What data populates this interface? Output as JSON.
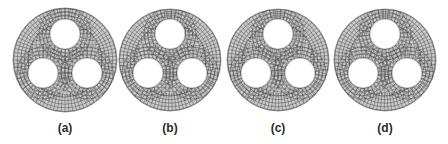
{
  "figure": {
    "panels": [
      {
        "label": "(a)",
        "cx": 65,
        "cy": 60,
        "r": 52,
        "mesh_variant": 0
      },
      {
        "label": "(b)",
        "cx": 170,
        "cy": 60,
        "r": 51,
        "mesh_variant": 1
      },
      {
        "label": "(c)",
        "cx": 278,
        "cy": 60,
        "r": 51,
        "mesh_variant": 2
      },
      {
        "label": "(d)",
        "cx": 385,
        "cy": 60,
        "r": 51,
        "mesh_variant": 3
      }
    ],
    "holes": [
      {
        "dx": 0,
        "dy": -26,
        "r": 15
      },
      {
        "dx": -22,
        "dy": 13,
        "r": 15
      },
      {
        "dx": 22,
        "dy": 13,
        "r": 15
      }
    ],
    "colors": {
      "mesh_fill": "#c9c9c9",
      "mesh_line": "#3c3c3c",
      "hole_fill": "#ffffff",
      "caption": "#2a2a2a"
    }
  }
}
